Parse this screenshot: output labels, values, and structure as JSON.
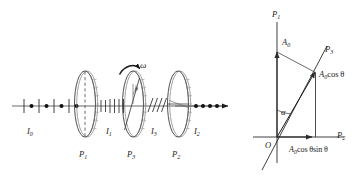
{
  "figure": {
    "ink_color": "#1a1a1a",
    "ray_color": "#555555",
    "background": "#ffffff"
  },
  "left_diagram": {
    "name": "polarizer-stack",
    "axis_label": "optical-axis",
    "rotation": {
      "symbol": "ω",
      "description": "rotation of middle polarizer"
    },
    "angle_symbol": "θ",
    "polarizers": [
      {
        "label": "P",
        "sub": "1",
        "transmission": "vertical"
      },
      {
        "label": "P",
        "sub": "3",
        "transmission": "tilted"
      },
      {
        "label": "P",
        "sub": "2",
        "transmission": "horizontal"
      }
    ],
    "intensities": [
      {
        "label": "I",
        "sub": "0",
        "state": "unpolarized"
      },
      {
        "label": "I",
        "sub": "1",
        "state": "vertical-linear"
      },
      {
        "label": "I",
        "sub": "3",
        "state": "tilted-linear"
      },
      {
        "label": "I",
        "sub": "2",
        "state": "horizontal-linear"
      }
    ]
  },
  "right_diagram": {
    "name": "amplitude-vector-decomposition",
    "origin_label": "O",
    "angle_label": "α",
    "axes": [
      {
        "label": "P",
        "sub": "1",
        "orientation": "vertical"
      },
      {
        "label": "P",
        "sub": "3",
        "orientation": "tilted"
      },
      {
        "label": "P",
        "sub": "2",
        "orientation": "horizontal"
      }
    ],
    "vectors": [
      {
        "name": "incident-amplitude",
        "label": "A",
        "sub": "0",
        "suffix": ""
      },
      {
        "name": "projection-on-p3",
        "label": "A",
        "sub": "0",
        "suffix": "cos θ"
      },
      {
        "name": "projection-on-p2",
        "label": "A",
        "sub": "0",
        "suffix": "cos θsin θ"
      }
    ]
  }
}
